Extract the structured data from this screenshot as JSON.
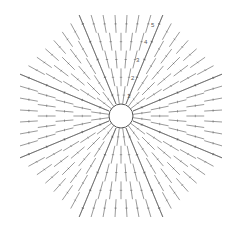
{
  "diagram": {
    "type": "crochet-chart",
    "shape": "octagon",
    "center": [
      121,
      116
    ],
    "ring_radius": 12,
    "rounds": 5,
    "round_labels": [
      "1",
      "2",
      "3",
      "4",
      "5"
    ],
    "stitch_color": "#555555",
    "background": "#ffffff"
  }
}
